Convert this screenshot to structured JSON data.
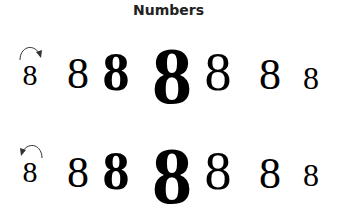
{
  "title": "Numbers",
  "rows": [
    {
      "direction": "clockwise",
      "arrow_icon": "curved-arrow-clockwise",
      "digits": [
        "8",
        "8",
        "8",
        "8",
        "8",
        "8",
        "8"
      ]
    },
    {
      "direction": "counterclockwise",
      "arrow_icon": "curved-arrow-counterclockwise",
      "digits": [
        "8",
        "8",
        "8",
        "8",
        "8",
        "8",
        "8"
      ]
    }
  ]
}
